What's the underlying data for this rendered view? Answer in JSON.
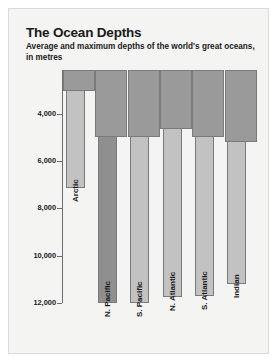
{
  "header": {
    "title": "The Ocean Depths",
    "subtitle": "Average and maximum depths of the world's great oceans, in metres"
  },
  "chart_data": {
    "type": "bar",
    "title": "The Ocean Depths",
    "subtitle": "Average and maximum depths of the world's great oceans, in metres",
    "xlabel": "",
    "ylabel": "metres",
    "units": "metres",
    "orientation": "vertical-downward",
    "y_axis_inverted": true,
    "ylim": [
      2150,
      12000
    ],
    "yticks": [
      4000,
      6000,
      8000,
      10000,
      12000
    ],
    "ytick_labels": [
      "4,000",
      "6,000",
      "8,000",
      "10,000",
      "12,000"
    ],
    "grid": false,
    "legend": "none",
    "categories": [
      "Arctic",
      "N. Pacific",
      "S. Pacific",
      "N. Atlantic",
      "S. Atlantic",
      "Indian"
    ],
    "series": [
      {
        "name": "Average depth",
        "values": [
          3050,
          5000,
          5000,
          4650,
          5000,
          5200
        ]
      },
      {
        "name": "Maximum depth",
        "values": [
          7150,
          12000,
          12000,
          11750,
          11700,
          11200
        ]
      }
    ],
    "colors": {
      "average": "#9a9a9a",
      "maximum": "#c2c2c2",
      "maximum_highlight": "#8f8f8f",
      "axis": "#6e6e6e",
      "text": "#1a1a1a",
      "background": "#f4f4f2"
    }
  }
}
